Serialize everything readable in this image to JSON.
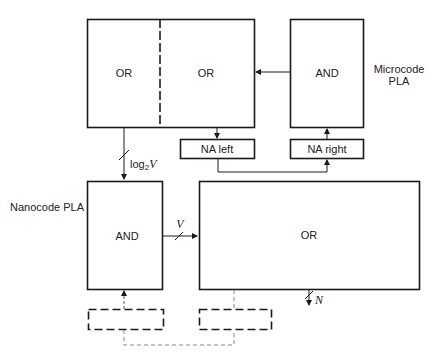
{
  "diagram": {
    "microcode_pla": {
      "label_line1": "Microcode",
      "label_line2": "PLA",
      "or_left_label": "OR",
      "or_right_label": "OR",
      "and_label": "AND",
      "na_left_label": "NA left",
      "na_right_label": "NA right"
    },
    "nanocode_pla": {
      "label": "Nanocode PLA",
      "and_label": "AND",
      "or_label": "OR"
    },
    "bus_labels": {
      "log2v_prefix": "log",
      "log2v_sub": "2",
      "log2v_var": "V",
      "v": "V",
      "n": "N"
    },
    "colors": {
      "line": "#1a1a1a",
      "dashed_connector": "#888888"
    }
  }
}
